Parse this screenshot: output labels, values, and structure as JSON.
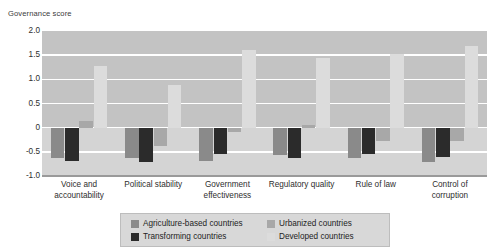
{
  "top_clipped_text": "",
  "axis": {
    "y_title": "Governance score",
    "y_ticks": [
      "2.0",
      "1.5",
      "1.0",
      "0.5",
      "0",
      "-0.5",
      "-1.0"
    ]
  },
  "legend": {
    "items": [
      {
        "label": "Agriculture-based countries",
        "color": "#8a8a8a"
      },
      {
        "label": "Transforming countries",
        "color": "#2b2b2b"
      },
      {
        "label": "Urbanized countries",
        "color": "#a8a8a8"
      },
      {
        "label": "Developed countries",
        "color": "#dcdcdc"
      }
    ]
  },
  "chart_data": {
    "type": "bar",
    "title": "",
    "xlabel": "",
    "ylabel": "Governance score",
    "ylim": [
      -1.0,
      2.0
    ],
    "ytick_step": 0.5,
    "grid": true,
    "legend_position": "bottom",
    "categories": [
      "Voice and accountability",
      "Political stability",
      "Government effectiveness",
      "Regulatory quality",
      "Rule of law",
      "Control of corruption"
    ],
    "series": [
      {
        "name": "Agriculture-based countries",
        "color": "#8a8a8a",
        "values": [
          -0.62,
          -0.62,
          -0.68,
          -0.56,
          -0.62,
          -0.72
        ]
      },
      {
        "name": "Transforming countries",
        "color": "#2b2b2b",
        "values": [
          -0.7,
          -0.72,
          -0.55,
          -0.62,
          -0.55,
          -0.6
        ]
      },
      {
        "name": "Urbanized countries",
        "color": "#a8a8a8",
        "values": [
          0.13,
          -0.38,
          -0.08,
          0.05,
          -0.28,
          -0.28
        ]
      },
      {
        "name": "Developed countries",
        "color": "#dcdcdc",
        "values": [
          1.28,
          0.88,
          1.6,
          1.45,
          1.52,
          1.7
        ]
      }
    ]
  },
  "style": {
    "plot_background": "#c3c3c3",
    "negative_band": "#d4d4d4",
    "gridline": "#ffffff",
    "legend_background": "#d8d8d8"
  }
}
